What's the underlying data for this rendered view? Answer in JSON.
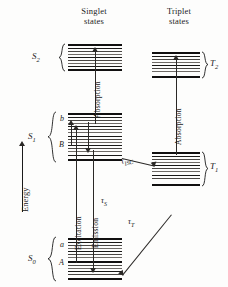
{
  "figure": {
    "type": "jablonski-energy-level-diagram",
    "columns": [
      {
        "id": "singlet",
        "line1": "Singlet",
        "line2": "states"
      },
      {
        "id": "triplet",
        "line1": "Triplet",
        "line2": "states"
      }
    ],
    "axis": {
      "label": "Energy",
      "direction": "up"
    },
    "states": [
      {
        "id": "S2",
        "label": "S",
        "sub": "2",
        "column": "singlet",
        "sublevels": []
      },
      {
        "id": "S1",
        "label": "S",
        "sub": "1",
        "column": "singlet",
        "sublevels": [
          {
            "id": "b",
            "label": "b"
          },
          {
            "id": "B",
            "label": "B"
          }
        ]
      },
      {
        "id": "S0",
        "label": "S",
        "sub": "0",
        "column": "singlet",
        "sublevels": [
          {
            "id": "a",
            "label": "a"
          },
          {
            "id": "A",
            "label": "A"
          }
        ]
      },
      {
        "id": "T2",
        "label": "T",
        "sub": "2",
        "column": "triplet",
        "sublevels": []
      },
      {
        "id": "T1",
        "label": "T",
        "sub": "1",
        "column": "triplet",
        "sublevels": []
      }
    ],
    "transitions": [
      {
        "id": "absorption-singlet",
        "label": "Absorption",
        "orientation": "vertical",
        "direction": "up"
      },
      {
        "id": "absorption-triplet",
        "label": "Absorption",
        "orientation": "vertical",
        "direction": "up"
      },
      {
        "id": "excitation",
        "label": "Excitation",
        "orientation": "vertical",
        "direction": "up"
      },
      {
        "id": "emission",
        "label": "Emission",
        "orientation": "vertical",
        "direction": "down"
      }
    ],
    "lifetimes": [
      {
        "id": "tau-S",
        "symbol": "τ",
        "sub": "S"
      },
      {
        "id": "tau-ISC",
        "symbol": "τ",
        "sub": "ISC"
      },
      {
        "id": "tau-T",
        "symbol": "τ",
        "sub": "T"
      }
    ],
    "colors": {
      "ink": "#1b1b1b",
      "line": "#2a2826",
      "background": "#fdfdfc"
    }
  }
}
